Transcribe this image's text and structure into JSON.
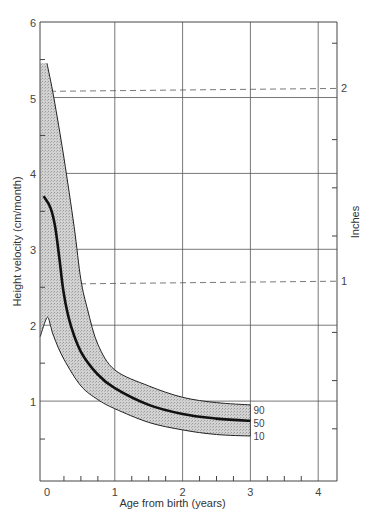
{
  "chart_data": {
    "type": "line",
    "title": "",
    "xlabel": "Age from birth (years)",
    "ylabel": "Height velocity (cm/month)",
    "ylabel_right": "Inches",
    "xlim": [
      0,
      4.2
    ],
    "ylim": [
      0,
      6
    ],
    "x_ticks": [
      "0",
      "1",
      "2",
      "3",
      "4"
    ],
    "y_ticks": [
      "1",
      "2",
      "3",
      "4",
      "5",
      "6"
    ],
    "right_ticks": [
      {
        "label": "1",
        "value_cm": 2.54
      },
      {
        "label": "2",
        "value_cm": 5.08
      }
    ],
    "grid": true,
    "shaded_band": {
      "between": [
        "10",
        "90"
      ],
      "pattern": "stipple"
    },
    "series": [
      {
        "name": "90",
        "x": [
          0,
          0.1,
          0.25,
          0.4,
          0.5,
          0.6,
          0.75,
          1,
          1.5,
          2,
          2.5,
          3
        ],
        "values": [
          5.45,
          5.0,
          4.2,
          3.3,
          2.6,
          2.2,
          1.75,
          1.41,
          1.2,
          1.05,
          0.98,
          0.95
        ]
      },
      {
        "name": "50",
        "x": [
          -0.05,
          0.05,
          0.12,
          0.18,
          0.25,
          0.35,
          0.5,
          0.75,
          1,
          1.5,
          2,
          2.5,
          3
        ],
        "values": [
          3.7,
          3.55,
          3.3,
          2.9,
          2.4,
          2.0,
          1.65,
          1.35,
          1.17,
          0.95,
          0.83,
          0.77,
          0.74
        ]
      },
      {
        "name": "10",
        "x": [
          -0.1,
          0.0,
          0.05,
          0.1,
          0.25,
          0.5,
          0.75,
          1,
          1.5,
          2,
          2.5,
          3
        ],
        "values": [
          1.85,
          2.1,
          2.0,
          1.85,
          1.55,
          1.2,
          1.02,
          0.9,
          0.72,
          0.62,
          0.56,
          0.54
        ]
      }
    ],
    "annotations": [
      "90",
      "50",
      "10"
    ]
  }
}
